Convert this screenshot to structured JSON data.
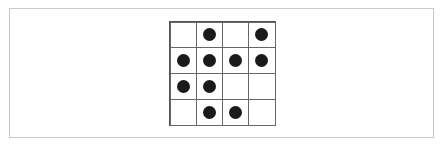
{
  "grid": {
    "rows": 4,
    "cols": 4,
    "cells": [
      [
        0,
        1,
        0,
        1
      ],
      [
        1,
        1,
        1,
        1
      ],
      [
        1,
        1,
        0,
        0
      ],
      [
        0,
        1,
        1,
        0
      ]
    ],
    "dot_color": "#1a1a1a",
    "line_color": "#666666"
  }
}
